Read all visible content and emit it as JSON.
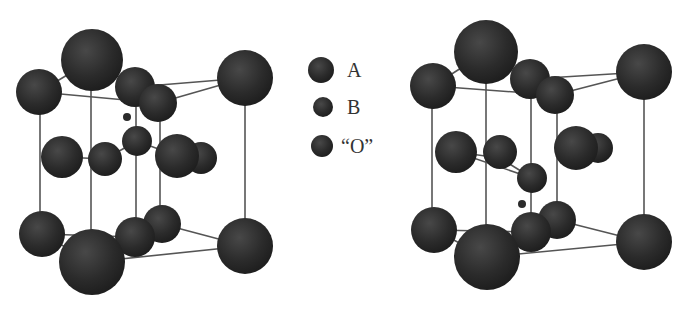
{
  "figure": {
    "colors": {
      "sphere": "#2b2b2b",
      "sphere_highlight": "#4a4a4a",
      "bond": "#555555",
      "background": "#ffffff"
    },
    "legend": [
      {
        "label": "A",
        "cx": 321,
        "cy": 70,
        "r": 13
      },
      {
        "label": "B",
        "cx": 323,
        "cy": 107,
        "r": 10
      },
      {
        "label": "“O”",
        "cx": 322,
        "cy": 146,
        "r": 11
      }
    ],
    "structures": [
      {
        "name": "left-structure",
        "lines": [
          [
            39,
            92,
            92,
            60
          ],
          [
            92,
            60,
            135,
            87
          ],
          [
            135,
            87,
            245,
            78
          ],
          [
            39,
            92,
            158,
            103
          ],
          [
            158,
            103,
            245,
            78
          ],
          [
            40,
            92,
            40,
            234
          ],
          [
            91,
            60,
            91,
            262
          ],
          [
            136,
            87,
            136,
            237
          ],
          [
            160,
            103,
            160,
            224
          ],
          [
            245,
            78,
            245,
            246
          ],
          [
            62,
            157,
            105,
            159
          ],
          [
            105,
            159,
            137,
            141
          ],
          [
            137,
            141,
            177,
            156
          ],
          [
            42,
            234,
            92,
            262
          ],
          [
            42,
            234,
            135,
            237
          ],
          [
            135,
            237,
            162,
            224
          ],
          [
            162,
            224,
            245,
            246
          ],
          [
            92,
            262,
            245,
            246
          ]
        ],
        "spheres": [
          {
            "cx": 92,
            "cy": 60,
            "r": 31
          },
          {
            "cx": 245,
            "cy": 78,
            "r": 28
          },
          {
            "cx": 39,
            "cy": 92,
            "r": 23
          },
          {
            "cx": 135,
            "cy": 87,
            "r": 20
          },
          {
            "cx": 158,
            "cy": 103,
            "r": 19
          },
          {
            "cx": 127,
            "cy": 117,
            "r": 4
          },
          {
            "cx": 137,
            "cy": 141,
            "r": 15
          },
          {
            "cx": 201,
            "cy": 158,
            "r": 16
          },
          {
            "cx": 177,
            "cy": 156,
            "r": 22
          },
          {
            "cx": 62,
            "cy": 157,
            "r": 21
          },
          {
            "cx": 105,
            "cy": 159,
            "r": 17
          },
          {
            "cx": 162,
            "cy": 224,
            "r": 19
          },
          {
            "cx": 42,
            "cy": 234,
            "r": 23
          },
          {
            "cx": 135,
            "cy": 237,
            "r": 20
          },
          {
            "cx": 245,
            "cy": 246,
            "r": 28
          },
          {
            "cx": 92,
            "cy": 262,
            "r": 33
          }
        ]
      },
      {
        "name": "right-structure",
        "lines": [
          [
            433,
            86,
            486,
            52
          ],
          [
            486,
            52,
            530,
            79
          ],
          [
            530,
            79,
            644,
            72
          ],
          [
            433,
            86,
            555,
            95
          ],
          [
            555,
            95,
            644,
            72
          ],
          [
            432,
            86,
            432,
            230
          ],
          [
            486,
            52,
            486,
            257
          ],
          [
            531,
            79,
            531,
            232
          ],
          [
            557,
            95,
            557,
            220
          ],
          [
            644,
            72,
            644,
            242
          ],
          [
            456,
            152,
            532,
            178
          ],
          [
            456,
            152,
            500,
            158
          ],
          [
            500,
            158,
            532,
            178
          ],
          [
            434,
            230,
            487,
            257
          ],
          [
            434,
            230,
            531,
            232
          ],
          [
            531,
            232,
            557,
            220
          ],
          [
            557,
            220,
            644,
            242
          ],
          [
            487,
            257,
            644,
            242
          ]
        ],
        "spheres": [
          {
            "cx": 486,
            "cy": 52,
            "r": 32
          },
          {
            "cx": 644,
            "cy": 72,
            "r": 28
          },
          {
            "cx": 433,
            "cy": 86,
            "r": 23
          },
          {
            "cx": 530,
            "cy": 79,
            "r": 20
          },
          {
            "cx": 555,
            "cy": 95,
            "r": 19
          },
          {
            "cx": 598,
            "cy": 148,
            "r": 15
          },
          {
            "cx": 576,
            "cy": 148,
            "r": 22
          },
          {
            "cx": 456,
            "cy": 152,
            "r": 21
          },
          {
            "cx": 500,
            "cy": 152,
            "r": 17
          },
          {
            "cx": 532,
            "cy": 178,
            "r": 15
          },
          {
            "cx": 522,
            "cy": 204,
            "r": 4
          },
          {
            "cx": 557,
            "cy": 220,
            "r": 19
          },
          {
            "cx": 434,
            "cy": 230,
            "r": 23
          },
          {
            "cx": 531,
            "cy": 232,
            "r": 20
          },
          {
            "cx": 644,
            "cy": 242,
            "r": 28
          },
          {
            "cx": 487,
            "cy": 257,
            "r": 33
          }
        ]
      }
    ]
  }
}
